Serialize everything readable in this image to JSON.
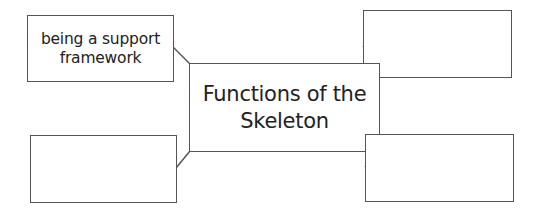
{
  "diagram": {
    "type": "spider-map",
    "center": {
      "lines": [
        "Functions of the",
        "Skeleton"
      ]
    },
    "branches": [
      {
        "position": "top-left",
        "lines": [
          "being a support",
          "framework"
        ]
      },
      {
        "position": "top-right",
        "lines": []
      },
      {
        "position": "bottom-left",
        "lines": []
      },
      {
        "position": "bottom-right",
        "lines": []
      }
    ],
    "colors": {
      "stroke": "#555555",
      "text": "#222222",
      "background": "#ffffff"
    }
  }
}
